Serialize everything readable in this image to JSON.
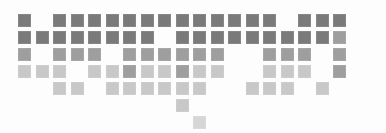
{
  "figure": {
    "name": "pixel-mosaic-graphic",
    "type": "tile-mosaic",
    "background_color": "#fdfdfd",
    "width": 386,
    "height": 133,
    "grid": {
      "columns": 19,
      "rows": 7,
      "origin_x": 18,
      "origin_y": 14,
      "cell_size": 13,
      "pitch_x": 17.5,
      "pitch_y": 17.0
    },
    "palette": {
      "dark": "#7a7a7a",
      "medium": "#9e9e9e",
      "light": "#c8c8c8",
      "pale": "#d6d6d6"
    },
    "legend_shades": [
      {
        "key": "dark",
        "label": "dark",
        "color": "#7a7a7a"
      },
      {
        "key": "medium",
        "label": "medium",
        "color": "#9e9e9e"
      },
      {
        "key": "light",
        "label": "light",
        "color": "#c8c8c8"
      },
      {
        "key": "pale",
        "label": "pale",
        "color": "#d6d6d6"
      }
    ],
    "row_counts": [
      17,
      18,
      14,
      15,
      13,
      1,
      1
    ],
    "total_cells": 79,
    "cells": [
      {
        "r": 0,
        "c": 0,
        "shade": "dark"
      },
      {
        "r": 0,
        "c": 2,
        "shade": "dark"
      },
      {
        "r": 0,
        "c": 3,
        "shade": "dark"
      },
      {
        "r": 0,
        "c": 4,
        "shade": "dark"
      },
      {
        "r": 0,
        "c": 5,
        "shade": "dark"
      },
      {
        "r": 0,
        "c": 6,
        "shade": "dark"
      },
      {
        "r": 0,
        "c": 7,
        "shade": "dark"
      },
      {
        "r": 0,
        "c": 8,
        "shade": "dark"
      },
      {
        "r": 0,
        "c": 9,
        "shade": "dark"
      },
      {
        "r": 0,
        "c": 10,
        "shade": "dark"
      },
      {
        "r": 0,
        "c": 11,
        "shade": "dark"
      },
      {
        "r": 0,
        "c": 12,
        "shade": "dark"
      },
      {
        "r": 0,
        "c": 13,
        "shade": "dark"
      },
      {
        "r": 0,
        "c": 14,
        "shade": "dark"
      },
      {
        "r": 0,
        "c": 16,
        "shade": "dark"
      },
      {
        "r": 0,
        "c": 17,
        "shade": "dark"
      },
      {
        "r": 0,
        "c": 18,
        "shade": "dark"
      },
      {
        "r": 1,
        "c": 0,
        "shade": "dark"
      },
      {
        "r": 1,
        "c": 1,
        "shade": "dark"
      },
      {
        "r": 1,
        "c": 2,
        "shade": "dark"
      },
      {
        "r": 1,
        "c": 3,
        "shade": "dark"
      },
      {
        "r": 1,
        "c": 4,
        "shade": "dark"
      },
      {
        "r": 1,
        "c": 5,
        "shade": "dark"
      },
      {
        "r": 1,
        "c": 6,
        "shade": "dark"
      },
      {
        "r": 1,
        "c": 7,
        "shade": "dark"
      },
      {
        "r": 1,
        "c": 9,
        "shade": "dark"
      },
      {
        "r": 1,
        "c": 10,
        "shade": "dark"
      },
      {
        "r": 1,
        "c": 11,
        "shade": "dark"
      },
      {
        "r": 1,
        "c": 12,
        "shade": "dark"
      },
      {
        "r": 1,
        "c": 13,
        "shade": "dark"
      },
      {
        "r": 1,
        "c": 14,
        "shade": "dark"
      },
      {
        "r": 1,
        "c": 15,
        "shade": "dark"
      },
      {
        "r": 1,
        "c": 16,
        "shade": "dark"
      },
      {
        "r": 1,
        "c": 17,
        "shade": "dark"
      },
      {
        "r": 1,
        "c": 18,
        "shade": "medium"
      },
      {
        "r": 2,
        "c": 0,
        "shade": "medium"
      },
      {
        "r": 2,
        "c": 2,
        "shade": "medium"
      },
      {
        "r": 2,
        "c": 3,
        "shade": "medium"
      },
      {
        "r": 2,
        "c": 4,
        "shade": "medium"
      },
      {
        "r": 2,
        "c": 6,
        "shade": "medium"
      },
      {
        "r": 2,
        "c": 7,
        "shade": "medium"
      },
      {
        "r": 2,
        "c": 8,
        "shade": "medium"
      },
      {
        "r": 2,
        "c": 9,
        "shade": "medium"
      },
      {
        "r": 2,
        "c": 10,
        "shade": "medium"
      },
      {
        "r": 2,
        "c": 11,
        "shade": "medium"
      },
      {
        "r": 2,
        "c": 14,
        "shade": "medium"
      },
      {
        "r": 2,
        "c": 15,
        "shade": "medium"
      },
      {
        "r": 2,
        "c": 16,
        "shade": "medium"
      },
      {
        "r": 2,
        "c": 18,
        "shade": "medium"
      },
      {
        "r": 3,
        "c": 0,
        "shade": "light"
      },
      {
        "r": 3,
        "c": 1,
        "shade": "light"
      },
      {
        "r": 3,
        "c": 2,
        "shade": "light"
      },
      {
        "r": 3,
        "c": 4,
        "shade": "light"
      },
      {
        "r": 3,
        "c": 5,
        "shade": "light"
      },
      {
        "r": 3,
        "c": 6,
        "shade": "medium"
      },
      {
        "r": 3,
        "c": 7,
        "shade": "light"
      },
      {
        "r": 3,
        "c": 8,
        "shade": "light"
      },
      {
        "r": 3,
        "c": 9,
        "shade": "medium"
      },
      {
        "r": 3,
        "c": 10,
        "shade": "light"
      },
      {
        "r": 3,
        "c": 11,
        "shade": "light"
      },
      {
        "r": 3,
        "c": 14,
        "shade": "light"
      },
      {
        "r": 3,
        "c": 15,
        "shade": "light"
      },
      {
        "r": 3,
        "c": 16,
        "shade": "light"
      },
      {
        "r": 3,
        "c": 18,
        "shade": "medium"
      },
      {
        "r": 4,
        "c": 2,
        "shade": "light"
      },
      {
        "r": 4,
        "c": 3,
        "shade": "light"
      },
      {
        "r": 4,
        "c": 5,
        "shade": "light"
      },
      {
        "r": 4,
        "c": 6,
        "shade": "light"
      },
      {
        "r": 4,
        "c": 7,
        "shade": "light"
      },
      {
        "r": 4,
        "c": 8,
        "shade": "light"
      },
      {
        "r": 4,
        "c": 9,
        "shade": "light"
      },
      {
        "r": 4,
        "c": 10,
        "shade": "light"
      },
      {
        "r": 4,
        "c": 13,
        "shade": "light"
      },
      {
        "r": 4,
        "c": 14,
        "shade": "light"
      },
      {
        "r": 4,
        "c": 15,
        "shade": "light"
      },
      {
        "r": 4,
        "c": 17,
        "shade": "light"
      },
      {
        "r": 5,
        "c": 9,
        "shade": "light"
      },
      {
        "r": 6,
        "c": 10,
        "shade": "pale"
      }
    ]
  }
}
